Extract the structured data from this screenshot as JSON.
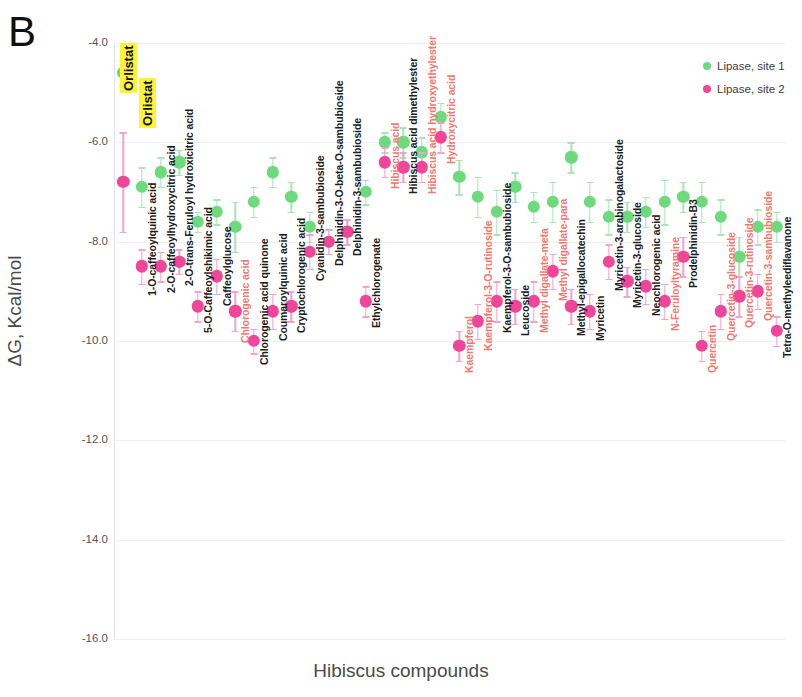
{
  "panel": {
    "label": "B"
  },
  "axes": {
    "y_title": "ΔG, Kcal/mol",
    "x_title": "Hibiscus compounds",
    "y_ticks": [
      "-4.0",
      "-6.0",
      "-8.0",
      "-10.0",
      "-12.0",
      "-14.0",
      "-16.0"
    ]
  },
  "legend": {
    "items": [
      {
        "label": "Lipase, site 1",
        "color": "#6ddb7d"
      },
      {
        "label": "Lipase, site 2",
        "color": "#f0469a"
      }
    ]
  },
  "annotations": [
    {
      "text": "Orlistat",
      "highlight": "#fdf33a"
    },
    {
      "text": "Orlistat",
      "highlight": "#fdf33a"
    }
  ],
  "colors": {
    "site1": "#6ddb7d",
    "site2": "#f0469a",
    "site1_err": "#a8e6b4",
    "site2_err": "#f6a2c8",
    "label_black": "#1d1d1d",
    "label_salmon": "#f2786e",
    "grid": "#f0f0f0",
    "highlight": "#fdf33a"
  },
  "chart_data": {
    "type": "scatter",
    "title": "",
    "xlabel": "Hibiscus compounds",
    "ylabel": "ΔG, Kcal/mol",
    "ylim": [
      -16.0,
      -4.0
    ],
    "ytick_step": 2.0,
    "grid": true,
    "legend_position": "top-right",
    "error_bars": "standard deviation",
    "categories": [
      "Orlistat",
      "1-O-caffeoylquinic acid",
      "2-O-caffeoylhydroxycitric acid",
      "2-O-trans-Feruloyl hydroxicitric acid",
      "5-O-Caffeoylshikimic acid",
      "Caffeoylglucose",
      "Chlorogenic acid",
      "Chlorogenic acid quinone",
      "Coumaroylquinic acid",
      "Cryptochlorogenic acid",
      "Cyanidin-3-sambubioside",
      "Delphinidin-3-O-beta-O-sambubioside",
      "Delphinidin-3-sambubioside",
      "Ethylchlorogenate",
      "Hibiscus acid",
      "Hibiscus acid dimethylester",
      "Hibiscus acid hydroxyethylester",
      "Hydroxycitric acid",
      "Kaempferol",
      "Kaempferol-3-O-rutinoside",
      "Kaempferol-3-O-sambubioside",
      "Leucoside",
      "Methyl digallate-meta",
      "Methyl digallate-para",
      "Methyl-epigallocatechin",
      "Myricetin",
      "Myricetin-3-arabinogalactoside",
      "Myricetin-3-glucoside",
      "Neochlorogenic acid",
      "N-Feruloyltyramine",
      "Prodelphinidin-B3",
      "Quercetin",
      "Quercetin-3-glucoside",
      "Quercetin-3-rutinoside",
      "Quercetin-3-sambubioside",
      "Tetra-O-methyleediflavanone"
    ],
    "category_label_colors": [
      "highlight",
      "black",
      "black",
      "black",
      "black",
      "black",
      "salmon",
      "black",
      "black",
      "black",
      "black",
      "black",
      "black",
      "black",
      "salmon",
      "black",
      "salmon",
      "salmon",
      "salmon",
      "salmon",
      "black",
      "black",
      "salmon",
      "salmon",
      "black",
      "black",
      "black",
      "black",
      "black",
      "salmon",
      "black",
      "salmon",
      "salmon",
      "salmon",
      "salmon",
      "black"
    ],
    "series": [
      {
        "name": "Lipase, site 1",
        "color": "#6ddb7d",
        "values": [
          -4.6,
          -6.9,
          -6.6,
          -6.4,
          -7.6,
          -7.4,
          -7.7,
          -7.2,
          -6.6,
          -7.1,
          -7.7,
          -8.0,
          -7.8,
          -7.0,
          -6.0,
          -6.0,
          -6.2,
          -5.5,
          -6.7,
          -7.1,
          -7.4,
          -6.9,
          -7.3,
          -7.2,
          -6.3,
          -7.2,
          -7.5,
          -7.5,
          -7.4,
          -7.2,
          -7.1,
          -7.2,
          -7.5,
          -8.3,
          -7.7,
          -7.7
        ],
        "errors": [
          0.25,
          0.4,
          0.3,
          0.25,
          0.2,
          0.25,
          0.5,
          0.3,
          0.3,
          0.3,
          0.3,
          0.25,
          0.25,
          0.25,
          0.2,
          0.3,
          0.3,
          0.3,
          0.35,
          0.4,
          0.45,
          0.3,
          0.3,
          0.4,
          0.3,
          0.4,
          0.35,
          0.3,
          0.3,
          0.45,
          0.3,
          0.4,
          0.35,
          0.4,
          0.35,
          0.3
        ]
      },
      {
        "name": "Lipase, site 2",
        "color": "#f0469a",
        "values": [
          -6.8,
          -8.5,
          -8.5,
          -8.4,
          -9.3,
          -8.7,
          -9.4,
          -10.0,
          -9.4,
          -9.3,
          -8.2,
          -8.0,
          -7.8,
          -9.2,
          -6.4,
          -6.5,
          -6.5,
          -5.9,
          -10.1,
          -9.6,
          -9.2,
          -9.3,
          -9.2,
          -8.6,
          -9.3,
          -9.4,
          -8.4,
          -8.8,
          -8.9,
          -9.2,
          -8.3,
          -10.1,
          -9.4,
          -9.1,
          -9.0,
          -9.8
        ],
        "errors": [
          1.0,
          0.35,
          0.3,
          0.25,
          0.3,
          0.35,
          0.4,
          0.25,
          0.35,
          0.3,
          0.35,
          0.25,
          0.25,
          0.3,
          0.3,
          0.3,
          0.3,
          0.3,
          0.3,
          0.35,
          0.4,
          0.35,
          0.4,
          0.35,
          0.35,
          0.35,
          0.35,
          0.3,
          0.35,
          0.35,
          0.4,
          0.3,
          0.35,
          0.4,
          0.35,
          0.3
        ]
      }
    ]
  }
}
